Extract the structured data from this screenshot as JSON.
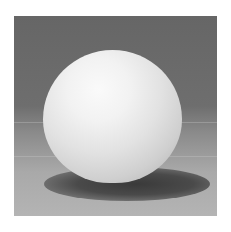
{
  "image": {
    "subject": "white sphere on gray surface",
    "alt": "Photograph of a white ball casting a soft shadow on a gray gradient background",
    "colors": {
      "background_top": "#666666",
      "background_bottom": "#b4b4b4",
      "sphere_highlight": "#fafafa",
      "sphere_shadow": "#a8a8a8",
      "cast_shadow": "#3a3a3a"
    }
  }
}
